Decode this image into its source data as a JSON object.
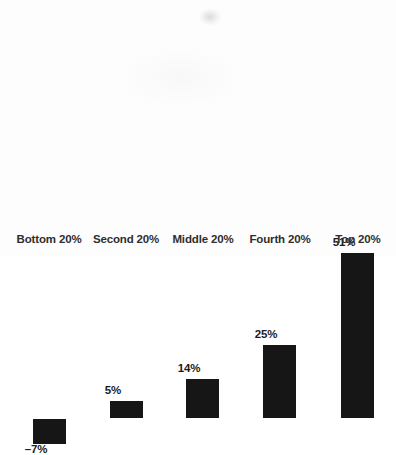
{
  "chart_data": {
    "type": "bar",
    "title": "",
    "subtitle": "",
    "xlabel": "",
    "ylabel": "",
    "grid": false,
    "legend": false,
    "legend_position": "none",
    "orientation": "vertical",
    "baseline_value": 0,
    "ylim": [
      -10,
      55
    ],
    "unit": "%",
    "categories": [
      "Bottom 20%",
      "Second 20%",
      "Middle 20%",
      "Fourth 20%",
      "Top 20%"
    ],
    "values": [
      -7,
      5,
      14,
      25,
      51
    ],
    "data_labels": [
      "–7%",
      "5%",
      "14%",
      "25%",
      "51%"
    ],
    "series": [
      {
        "name": "",
        "values": [
          -7,
          5,
          14,
          25,
          51
        ],
        "color": "#161616"
      }
    ],
    "bar_color": "#161616",
    "axis_color": "#2b2b2b",
    "label_color": "#2e2e2e",
    "background": "#fdfdfd"
  },
  "bars": [
    {
      "category": "Bottom 20%",
      "value": -7,
      "label": "–7%",
      "left": 33,
      "top": 187,
      "height": 25,
      "label_top": 211,
      "label_left": 6
    },
    {
      "category": "Second 20%",
      "value": 5,
      "label": "5%",
      "left": 110,
      "top": 169,
      "height": 17,
      "label_top": 152,
      "label_left": 83
    },
    {
      "category": "Middle 20%",
      "value": 14,
      "label": "14%",
      "left": 186,
      "top": 147,
      "height": 39,
      "label_top": 130,
      "label_left": 159
    },
    {
      "category": "Fourth 20%",
      "value": 25,
      "label": "25%",
      "left": 263,
      "top": 113,
      "height": 73,
      "label_top": 96,
      "label_left": 236
    },
    {
      "category": "Top 20%",
      "value": 51,
      "label": "51%",
      "left": 341,
      "top": 21,
      "height": 165,
      "label_top": 4,
      "label_left": 314
    }
  ],
  "category_labels": [
    {
      "text": "Bottom 20%",
      "left": 4
    },
    {
      "text": "Second 20%",
      "left": 81
    },
    {
      "text": "Middle 20%",
      "left": 158
    },
    {
      "text": "Fourth 20%",
      "left": 235
    },
    {
      "text": "Top 20%",
      "left": 313
    }
  ]
}
